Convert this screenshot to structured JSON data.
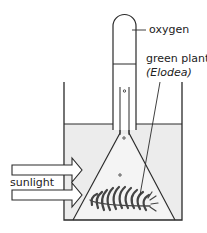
{
  "diagram": {
    "labels": {
      "oxygen": "oxygen",
      "plant": "green plant",
      "plant_species": "(Elodea)",
      "light": "sunlight"
    },
    "colors": {
      "line": "#2a2a2a",
      "water": "#ececec",
      "plant": "#555555",
      "background": "#ffffff"
    }
  }
}
